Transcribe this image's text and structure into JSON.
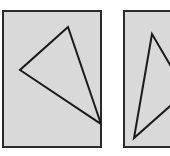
{
  "figure": {
    "width": 170,
    "height": 156,
    "background_color": "#ffffff",
    "panel_fill_color": "#d9d9d9",
    "panel_border_color": "#2b2b2b",
    "panel_border_width": 2,
    "shape_stroke_color": "#1a1a1a",
    "shape_stroke_width": 2,
    "panel_count": 2,
    "shape_type": "triangle",
    "shape_fill": "none"
  },
  "panels": [
    {
      "id": "panel-left",
      "label": "Left panel",
      "clipped": false,
      "rect": {
        "x": 3,
        "y": 11,
        "width": 98,
        "height": 136
      },
      "triangle": {
        "label": "Left triangle",
        "points": "68,27 20,70 101,124",
        "vertices": [
          {
            "name": "apex-top",
            "x": 68,
            "y": 27
          },
          {
            "name": "vertex-left",
            "x": 20,
            "y": 70
          },
          {
            "name": "vertex-bottom-right",
            "x": 101,
            "y": 124
          }
        ]
      }
    },
    {
      "id": "panel-right",
      "label": "Right panel (cropped at image edge)",
      "clipped": true,
      "rect": {
        "x": 124,
        "y": 11,
        "width": 50,
        "height": 136
      },
      "triangle": {
        "label": "Right triangle",
        "points": "152,34 134,138 186,92",
        "vertices": [
          {
            "name": "apex-top",
            "x": 152,
            "y": 34
          },
          {
            "name": "vertex-bottom-left",
            "x": 134,
            "y": 138
          },
          {
            "name": "vertex-right-offscreen",
            "x": 186,
            "y": 92
          }
        ]
      }
    }
  ]
}
